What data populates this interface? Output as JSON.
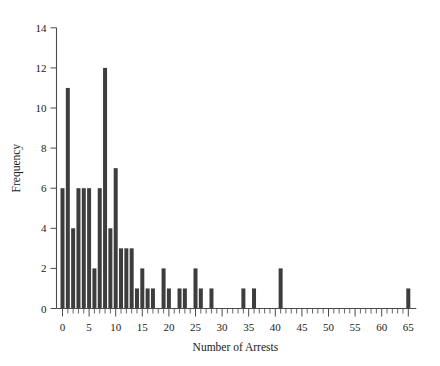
{
  "chart_data": {
    "type": "bar",
    "title": "",
    "xlabel": "Number of Arrests",
    "ylabel": "Frequency",
    "xlim": [
      -1,
      67
    ],
    "ylim": [
      0,
      14
    ],
    "grid": false,
    "legend": null,
    "x_major_ticks": [
      0,
      5,
      10,
      15,
      20,
      25,
      30,
      35,
      40,
      45,
      50,
      55,
      60,
      65
    ],
    "x_major_tick_labels": [
      "0",
      "5",
      "10",
      "15",
      "20",
      "25",
      "30",
      "35",
      "40",
      "45",
      "50",
      "55",
      "60",
      "65"
    ],
    "x_minor_tick_step": 1,
    "y_major_ticks": [
      0,
      2,
      4,
      6,
      8,
      10,
      12,
      14
    ],
    "y_major_tick_labels": [
      "0",
      "2",
      "4",
      "6",
      "8",
      "10",
      "12",
      "14"
    ],
    "bar_color": "#3d3d3d",
    "categories": [
      0,
      1,
      2,
      3,
      4,
      5,
      6,
      7,
      8,
      9,
      10,
      11,
      12,
      13,
      14,
      15,
      16,
      17,
      19,
      20,
      22,
      23,
      25,
      26,
      28,
      34,
      36,
      41,
      65
    ],
    "values": [
      6,
      11,
      4,
      6,
      6,
      6,
      2,
      6,
      12,
      4,
      7,
      3,
      3,
      3,
      1,
      2,
      1,
      1,
      2,
      1,
      1,
      1,
      2,
      1,
      1,
      1,
      1,
      2,
      1
    ]
  },
  "labels": {
    "x_axis_title": "Number of Arrests",
    "y_axis_title": "Frequency"
  }
}
